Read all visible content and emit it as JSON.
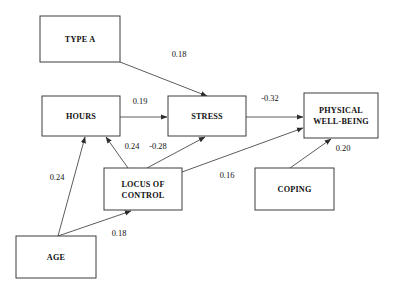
{
  "diagram": {
    "type": "path-diagram",
    "title": "",
    "nodes": [
      {
        "id": "type_a",
        "label": "TYPE A",
        "lines": [
          "TYPE A"
        ],
        "x": 40,
        "y": 16,
        "w": 80,
        "h": 46
      },
      {
        "id": "hours",
        "label": "HOURS",
        "lines": [
          "HOURS"
        ],
        "x": 42,
        "y": 96,
        "w": 78,
        "h": 40
      },
      {
        "id": "stress",
        "label": "STRESS",
        "lines": [
          "STRESS"
        ],
        "x": 168,
        "y": 96,
        "w": 78,
        "h": 40
      },
      {
        "id": "pwb",
        "label": "PHYSICAL WELL-BEING",
        "lines": [
          "PHYSICAL",
          "WELL-BEING"
        ],
        "x": 304,
        "y": 93,
        "w": 74,
        "h": 45
      },
      {
        "id": "locus",
        "label": "LOCUS OF CONTROL",
        "lines": [
          "LOCUS OF",
          "CONTROL"
        ],
        "x": 104,
        "y": 168,
        "w": 78,
        "h": 42
      },
      {
        "id": "coping",
        "label": "COPING",
        "lines": [
          "COPING"
        ],
        "x": 255,
        "y": 168,
        "w": 79,
        "h": 42
      },
      {
        "id": "age",
        "label": "AGE",
        "lines": [
          "AGE"
        ],
        "x": 16,
        "y": 236,
        "w": 80,
        "h": 42
      }
    ],
    "paths": [
      {
        "id": "type_a_to_stress",
        "from": "type_a",
        "to": "stress",
        "coefficient": "0.18",
        "x1": 120,
        "y1": 62,
        "x2": 207,
        "y2": 96,
        "lx": 179,
        "ly": 57
      },
      {
        "id": "hours_to_stress",
        "from": "hours",
        "to": "stress",
        "coefficient": "0.19",
        "x1": 120,
        "y1": 117,
        "x2": 167,
        "y2": 117,
        "lx": 140,
        "ly": 104
      },
      {
        "id": "stress_to_pwb",
        "from": "stress",
        "to": "pwb",
        "coefficient": "-0.32",
        "x1": 246,
        "y1": 117,
        "x2": 303,
        "y2": 117,
        "lx": 270,
        "ly": 101
      },
      {
        "id": "locus_to_hours",
        "from": "locus",
        "to": "hours",
        "coefficient": "0.24",
        "x1": 128,
        "y1": 168,
        "x2": 106,
        "y2": 137,
        "lx": 132,
        "ly": 149
      },
      {
        "id": "locus_to_stress",
        "from": "locus",
        "to": "stress",
        "coefficient": "-0.28",
        "x1": 147,
        "y1": 168,
        "x2": 205,
        "y2": 137,
        "lx": 158,
        "ly": 149
      },
      {
        "id": "locus_to_pwb",
        "from": "locus",
        "to": "pwb",
        "coefficient": "0.16",
        "x1": 182,
        "y1": 172,
        "x2": 303,
        "y2": 128,
        "lx": 227,
        "ly": 178
      },
      {
        "id": "coping_to_pwb",
        "from": "coping",
        "to": "pwb",
        "coefficient": "0.20",
        "x1": 290,
        "y1": 168,
        "x2": 331,
        "y2": 139,
        "lx": 343,
        "ly": 151
      },
      {
        "id": "age_to_hours",
        "from": "age",
        "to": "hours",
        "coefficient": "0.24",
        "x1": 58,
        "y1": 236,
        "x2": 85,
        "y2": 137,
        "lx": 57,
        "ly": 180
      },
      {
        "id": "age_to_locus",
        "from": "age",
        "to": "locus",
        "coefficient": "0.18",
        "x1": 58,
        "y1": 236,
        "x2": 131,
        "y2": 211,
        "lx": 119,
        "ly": 236
      }
    ],
    "colors": {
      "background": "#ffffff",
      "box_stroke": "#3d3d3d",
      "line_stroke": "#4a4a4a",
      "text": "#111111"
    }
  }
}
